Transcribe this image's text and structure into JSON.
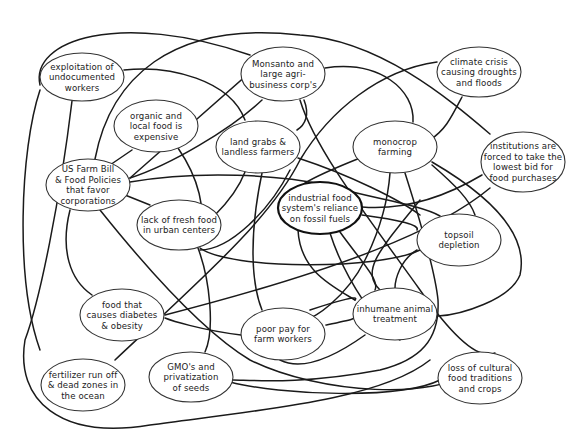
{
  "diagram": {
    "type": "concept-web",
    "colors": {
      "line": "#1a1a1a",
      "node_border": "#333333",
      "text": "#222222",
      "background": "#ffffff"
    },
    "nodes": [
      {
        "id": "exploitation",
        "cx": 82,
        "cy": 77,
        "rx": 42,
        "ry": 24,
        "lines": [
          "exploitation of",
          "undocumented",
          "workers"
        ]
      },
      {
        "id": "monsanto",
        "cx": 283,
        "cy": 74,
        "rx": 42,
        "ry": 27,
        "lines": [
          "Monsanto and",
          "large agri-",
          "business corp's"
        ]
      },
      {
        "id": "climate",
        "cx": 479,
        "cy": 72,
        "rx": 42,
        "ry": 25,
        "lines": [
          "climate crisis",
          "causing droughts",
          "and floods"
        ]
      },
      {
        "id": "organic",
        "cx": 156,
        "cy": 126,
        "rx": 42,
        "ry": 26,
        "lines": [
          "organic and",
          "local food is",
          "expensive"
        ]
      },
      {
        "id": "landgrabs",
        "cx": 258,
        "cy": 147,
        "rx": 42,
        "ry": 26,
        "lines": [
          "land grabs &",
          "landless farmers"
        ]
      },
      {
        "id": "monocrop",
        "cx": 395,
        "cy": 147,
        "rx": 42,
        "ry": 26,
        "lines": [
          "monocrop",
          "farming"
        ]
      },
      {
        "id": "institutions",
        "cx": 523,
        "cy": 162,
        "rx": 42,
        "ry": 30,
        "lines": [
          "institutions are",
          "forced to take the",
          "lowest bid for",
          "food purchases"
        ]
      },
      {
        "id": "usfarmbill",
        "cx": 88,
        "cy": 185,
        "rx": 42,
        "ry": 26,
        "lines": [
          "US Farm Bill",
          "& Food Policies",
          "that favor",
          "corporations"
        ]
      },
      {
        "id": "industrial",
        "cx": 320,
        "cy": 208,
        "rx": 42,
        "ry": 26,
        "central": true,
        "lines": [
          "industrial food",
          "system's reliance",
          "on fossil fuels"
        ]
      },
      {
        "id": "lackfresh",
        "cx": 179,
        "cy": 225,
        "rx": 42,
        "ry": 25,
        "lines": [
          "lack of fresh food",
          "in urban centers"
        ]
      },
      {
        "id": "topsoil",
        "cx": 459,
        "cy": 240,
        "rx": 42,
        "ry": 26,
        "lines": [
          "topsoil",
          "depletion"
        ]
      },
      {
        "id": "diabetes",
        "cx": 122,
        "cy": 315,
        "rx": 42,
        "ry": 26,
        "lines": [
          "food that",
          "causes diabetes",
          "& obesity"
        ]
      },
      {
        "id": "poorpay",
        "cx": 283,
        "cy": 334,
        "rx": 42,
        "ry": 26,
        "lines": [
          "poor pay for",
          "farm workers"
        ]
      },
      {
        "id": "inhumane",
        "cx": 395,
        "cy": 314,
        "rx": 42,
        "ry": 26,
        "lines": [
          "inhumane animal",
          "treatment"
        ]
      },
      {
        "id": "fertilizer",
        "cx": 83,
        "cy": 385,
        "rx": 42,
        "ry": 26,
        "lines": [
          "fertilizer run off",
          "& dead zones in",
          "the ocean"
        ]
      },
      {
        "id": "gmo",
        "cx": 191,
        "cy": 377,
        "rx": 42,
        "ry": 25,
        "lines": [
          "GMO's and",
          "privatization",
          "of seeds"
        ]
      },
      {
        "id": "cultural",
        "cx": 480,
        "cy": 378,
        "rx": 42,
        "ry": 26,
        "lines": [
          "loss of cultural",
          "food traditions",
          "and crops"
        ]
      }
    ],
    "edges": [
      "M 40 90 C 20 150, 15 280, 40 350",
      "M 40 85 C 30 40, 120 10, 250 55",
      "M 72 101 C 60 200, 40 300, 25 340 C 15 400, 60 440, 150 425 C 260 410, 380 400, 430 360",
      "M 124 70 C 170 65, 230 80, 245 120",
      "M 95 159 C 110 80, 170 20, 300 35 C 380 40, 450 100, 490 134",
      "M 110 165 L 132 150",
      "M 130 178 C 170 165, 230 130, 262 100",
      "M 130 182 C 200 170, 280 175, 325 185 C 380 200, 420 205, 440 216",
      "M 125 195 L 150 205",
      "M 70 210 C 60 250, 70 280, 92 295",
      "M 100 210 C 140 260, 200 330, 250 360 C 320 395, 440 400, 470 370",
      "M 178 148 C 200 180, 205 210, 200 230",
      "M 215 215 C 230 200, 240 185, 245 172",
      "M 200 248 C 230 270, 380 270, 420 250",
      "M 198 248 C 210 280, 215 330, 205 352",
      "M 264 60 L 130 178",
      "M 300 100 C 315 150, 370 220, 420 290 C 455 340, 480 360, 495 353",
      "M 325 68 C 380 60, 415 90, 413 122",
      "M 304 100 C 310 115, 305 125, 297 130",
      "M 262 173 C 250 230, 250 280, 262 310",
      "M 298 158 C 350 175, 400 200, 420 215",
      "M 290 170 C 270 210, 230 250, 200 250",
      "M 437 62 C 380 70, 330 110, 300 160 C 270 220, 200 280, 115 360",
      "M 462 97 C 450 120, 445 130, 430 140",
      "M 360 158 C 330 170, 310 180, 305 183",
      "M 390 173 C 388 200, 380 230, 365 260 C 345 300, 310 320, 312 316",
      "M 405 173 C 420 220, 435 270, 438 300 C 440 340, 420 360, 380 370 C 300 385, 250 380, 233 380",
      "M 432 162 C 480 190, 530 230, 520 275 C 510 300, 460 315, 438 316",
      "M 432 165 C 455 185, 470 200, 475 215",
      "M 482 175 C 440 200, 400 210, 362 207",
      "M 490 188 C 440 230, 340 270, 165 315",
      "M 362 215 C 400 220, 420 225, 417 230",
      "M 340 232 C 360 260, 380 280, 375 290",
      "M 298 230 C 300 270, 330 285, 355 300",
      "M 330 233 C 345 280, 380 330, 400 340",
      "M 417 250 C 400 260, 395 280, 395 288",
      "M 365 335 C 330 360, 300 370, 280 360",
      "M 310 310 C 340 300, 360 295, 355 300",
      "M 326 325 C 350 320, 360 318, 355 315",
      "M 241 335 C 200 330, 170 320, 165 318",
      "M 230 382 C 280 395, 400 400, 440 380",
      "M 420 200 C 380 250, 360 270, 380 290"
    ]
  }
}
